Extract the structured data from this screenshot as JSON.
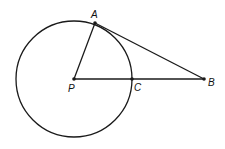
{
  "diagram": {
    "type": "circle-tangent-geometry",
    "points": {
      "A": {
        "label": "A",
        "x": 95,
        "y": 23
      },
      "P": {
        "label": "P",
        "x": 74,
        "y": 79
      },
      "C": {
        "label": "C",
        "x": 132,
        "y": 79
      },
      "B": {
        "label": "B",
        "x": 204,
        "y": 79
      }
    },
    "circle": {
      "center": "P",
      "radius": 58
    },
    "segments": [
      [
        "P",
        "A"
      ],
      [
        "A",
        "B"
      ],
      [
        "P",
        "B"
      ]
    ],
    "stroke_color": "#1a1a1a"
  }
}
